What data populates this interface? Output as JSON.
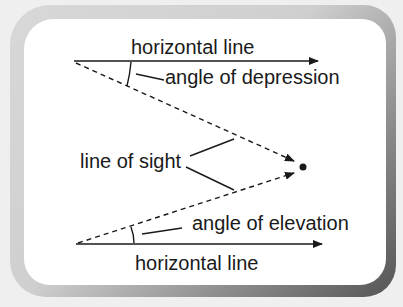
{
  "diagram": {
    "labels": {
      "top_horizontal": "horizontal line",
      "depression": "angle of depression",
      "line_of_sight": "line of sight",
      "elevation": "angle of elevation",
      "bottom_horizontal": "horizontal line"
    },
    "colors": {
      "ink": "#1a1a1a",
      "panel": "#ffffff",
      "frame_light": "#d8d8d8",
      "frame_dark": "#555555",
      "background": "#efefef"
    }
  }
}
